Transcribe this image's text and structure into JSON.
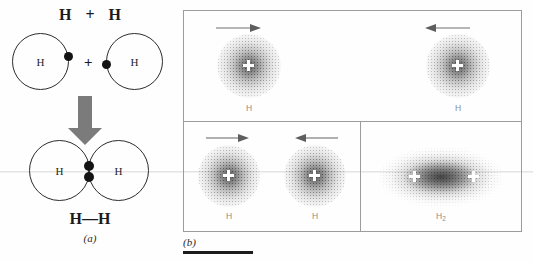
{
  "figure": {
    "panel_a": {
      "caption": "(a)",
      "reactants_expression": {
        "left_symbol": "H",
        "operator": "+",
        "right_symbol": "H"
      },
      "atoms": [
        {
          "label": "H",
          "electron_dot": "single-electron",
          "dot_position": "right-edge"
        },
        {
          "label": "H",
          "electron_dot": "single-electron",
          "dot_position": "left-edge"
        }
      ],
      "middle_operator": "+",
      "arrow": {
        "icon": "down-block-arrow",
        "color": "#7a7a7a",
        "direction": "down"
      },
      "product_atoms": [
        {
          "label": "H"
        },
        {
          "label": "H"
        }
      ],
      "shared_electrons": 2,
      "product_label": "H—H"
    },
    "panel_b": {
      "caption": "(b)",
      "cells": [
        {
          "name": "far-apart-atoms",
          "atoms": [
            {
              "label": "H",
              "nucleus": "+",
              "arrow": "right-arrow"
            },
            {
              "label": "H",
              "nucleus": "+",
              "arrow": "left-arrow"
            }
          ]
        },
        {
          "name": "approaching-atoms",
          "atoms": [
            {
              "label": "H",
              "nucleus": "+",
              "arrow": "right-arrow"
            },
            {
              "label": "H",
              "nucleus": "+",
              "arrow": "left-arrow"
            }
          ]
        },
        {
          "name": "bonded-molecule",
          "atoms": [
            {
              "label": "H2",
              "nucleus": "+"
            }
          ],
          "molecule_label": "H",
          "molecule_subscript": "2"
        }
      ]
    },
    "colors": {
      "ink": "#1a1a1a",
      "circle_stroke": "#2c2c2c",
      "arrow_gray": "#7a7a7a",
      "panel_border": "#9c9c9c",
      "cloud_gray": "#6e6e6e",
      "label_gray": "#8d8d8d",
      "rule_bar": "#1c1c1c"
    }
  }
}
